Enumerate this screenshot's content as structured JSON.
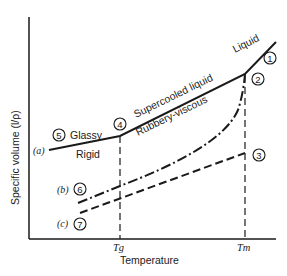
{
  "axes": {
    "ylabel": "Specific volume (l/ρ)",
    "xlabel": "Temperature",
    "x_ticks": [
      {
        "label": "Tg",
        "x": 120
      },
      {
        "label": "Tm",
        "x": 245
      }
    ]
  },
  "region_labels": {
    "liquid": "Liquid",
    "supercooled": "Supercooled liquid",
    "rubbery": "Rubbery-viscous",
    "glassy": "Glassy",
    "rigid": "Rigid"
  },
  "curve_labels": {
    "a": "(a)",
    "b": "(b)",
    "c": "(c)"
  },
  "points": {
    "p1": "1",
    "p2": "2",
    "p3": "3",
    "p4": "4",
    "p5": "5",
    "p6": "6",
    "p7": "7"
  },
  "colors": {
    "ink": "#1a1a1a",
    "background": "#ffffff"
  }
}
